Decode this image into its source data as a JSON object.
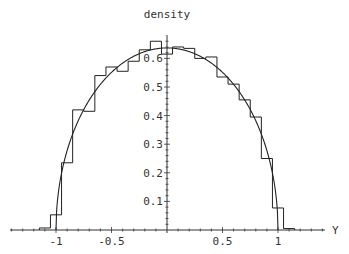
{
  "chart_data": {
    "type": "bar",
    "subtype": "histogram_with_density_curve",
    "title": "density",
    "xlabel": "Y",
    "ylabel": "",
    "xlim": [
      -1.4,
      1.4
    ],
    "ylim": [
      0,
      0.67
    ],
    "grid": false,
    "legend": null,
    "x_ticks": [
      -1,
      -0.5,
      0.5,
      1
    ],
    "x_tick_labels": [
      "-1",
      "-0.5",
      "0.5",
      "1"
    ],
    "y_ticks": [
      0.1,
      0.2,
      0.3,
      0.4,
      0.5,
      0.6
    ],
    "y_tick_labels": [
      "0.1",
      "0.2",
      "0.3",
      "0.4",
      "0.5",
      "0.6"
    ],
    "bin_width": 0.1,
    "bins": [
      {
        "from": -1.15,
        "to": -1.05,
        "value": 0.007
      },
      {
        "from": -1.05,
        "to": -0.95,
        "value": 0.053
      },
      {
        "from": -0.95,
        "to": -0.85,
        "value": 0.235
      },
      {
        "from": -0.85,
        "to": -0.75,
        "value": 0.42
      },
      {
        "from": -0.75,
        "to": -0.65,
        "value": 0.415
      },
      {
        "from": -0.65,
        "to": -0.55,
        "value": 0.54
      },
      {
        "from": -0.55,
        "to": -0.45,
        "value": 0.57
      },
      {
        "from": -0.45,
        "to": -0.35,
        "value": 0.555
      },
      {
        "from": -0.35,
        "to": -0.25,
        "value": 0.59
      },
      {
        "from": -0.25,
        "to": -0.15,
        "value": 0.63
      },
      {
        "from": -0.15,
        "to": -0.05,
        "value": 0.66
      },
      {
        "from": -0.05,
        "to": 0.05,
        "value": 0.615
      },
      {
        "from": 0.05,
        "to": 0.15,
        "value": 0.64
      },
      {
        "from": 0.15,
        "to": 0.25,
        "value": 0.635
      },
      {
        "from": 0.25,
        "to": 0.35,
        "value": 0.6
      },
      {
        "from": 0.35,
        "to": 0.45,
        "value": 0.605
      },
      {
        "from": 0.45,
        "to": 0.55,
        "value": 0.535
      },
      {
        "from": 0.55,
        "to": 0.65,
        "value": 0.51
      },
      {
        "from": 0.65,
        "to": 0.75,
        "value": 0.455
      },
      {
        "from": 0.75,
        "to": 0.85,
        "value": 0.395
      },
      {
        "from": 0.85,
        "to": 0.95,
        "value": 0.25
      },
      {
        "from": 0.95,
        "to": 1.05,
        "value": 0.077
      },
      {
        "from": 1.05,
        "to": 1.15,
        "value": 0.005
      }
    ],
    "curve": {
      "name": "semicircle density",
      "formula": "(2/pi)*sqrt(1-y^2)",
      "domain": [
        -1,
        1
      ],
      "peak": 0.637
    },
    "colors": {
      "line": "#222222",
      "axis": "#333333",
      "background": "#ffffff"
    }
  }
}
